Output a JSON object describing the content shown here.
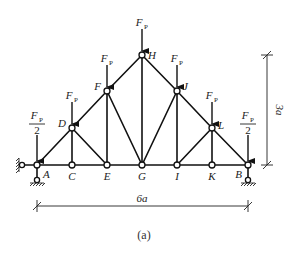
{
  "figure": {
    "caption": "(a)"
  },
  "geometry": {
    "span_label": "6a",
    "height_label": "3a",
    "panel_count": 6
  },
  "nodes": [
    {
      "id": "A",
      "label": "A",
      "x": 37,
      "y": 165
    },
    {
      "id": "C",
      "label": "C",
      "x": 72,
      "y": 165
    },
    {
      "id": "E",
      "label": "E",
      "x": 107,
      "y": 165
    },
    {
      "id": "G",
      "label": "G",
      "x": 142,
      "y": 165
    },
    {
      "id": "I",
      "label": "I",
      "x": 177,
      "y": 165
    },
    {
      "id": "K",
      "label": "K",
      "x": 212,
      "y": 165
    },
    {
      "id": "B",
      "label": "B",
      "x": 248,
      "y": 165
    },
    {
      "id": "D",
      "label": "D",
      "x": 72,
      "y": 128
    },
    {
      "id": "F",
      "label": "F",
      "x": 107,
      "y": 91
    },
    {
      "id": "H",
      "label": "H",
      "x": 142,
      "y": 55
    },
    {
      "id": "J",
      "label": "J",
      "x": 177,
      "y": 91
    },
    {
      "id": "L",
      "label": "L",
      "x": 212,
      "y": 128
    }
  ],
  "members": [
    [
      "A",
      "C"
    ],
    [
      "C",
      "E"
    ],
    [
      "E",
      "G"
    ],
    [
      "G",
      "I"
    ],
    [
      "I",
      "K"
    ],
    [
      "K",
      "B"
    ],
    [
      "A",
      "D"
    ],
    [
      "D",
      "F"
    ],
    [
      "F",
      "H"
    ],
    [
      "H",
      "J"
    ],
    [
      "J",
      "L"
    ],
    [
      "L",
      "B"
    ],
    [
      "D",
      "C"
    ],
    [
      "F",
      "E"
    ],
    [
      "H",
      "G"
    ],
    [
      "J",
      "I"
    ],
    [
      "L",
      "K"
    ],
    [
      "D",
      "E"
    ],
    [
      "F",
      "G"
    ],
    [
      "J",
      "G"
    ],
    [
      "L",
      "I"
    ]
  ],
  "loads": [
    {
      "node": "A",
      "label": "F_P/2",
      "main": "F",
      "sub": "P",
      "half": true
    },
    {
      "node": "D",
      "label": "F_P",
      "main": "F",
      "sub": "P",
      "half": false
    },
    {
      "node": "F",
      "label": "F_P",
      "main": "F",
      "sub": "P",
      "half": false
    },
    {
      "node": "H",
      "label": "F_P",
      "main": "F",
      "sub": "P",
      "half": false
    },
    {
      "node": "J",
      "label": "F_P",
      "main": "F",
      "sub": "P",
      "half": false
    },
    {
      "node": "L",
      "label": "F_P",
      "main": "F",
      "sub": "P",
      "half": false
    },
    {
      "node": "B",
      "label": "F_P/2",
      "main": "F",
      "sub": "P",
      "half": true
    }
  ],
  "supports": [
    {
      "node": "A",
      "type": "pin (two links: horizontal + vertical)"
    },
    {
      "node": "B",
      "type": "roller (vertical link)"
    }
  ],
  "half_denominator": "2"
}
